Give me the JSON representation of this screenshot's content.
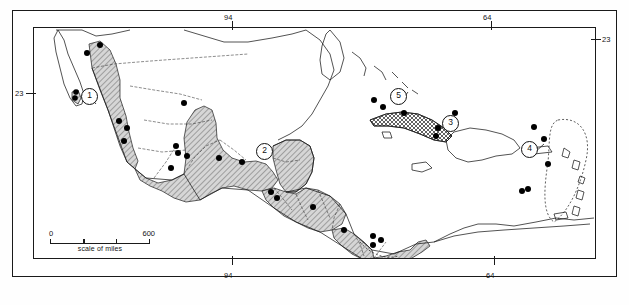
{
  "figure": {
    "kind": "distribution-map",
    "region": "Mexico, Central America and the Caribbean",
    "partial_caption": ""
  },
  "graticule": {
    "labels": [
      {
        "name": "top-longitude-94",
        "text": "94",
        "x": 228,
        "y": 13,
        "tick": "down"
      },
      {
        "name": "top-longitude-64",
        "text": "64",
        "x": 487,
        "y": 13,
        "tick": "down"
      },
      {
        "name": "left-latitude-23",
        "text": "23",
        "x": 16,
        "y": 92,
        "tick": "right"
      },
      {
        "name": "right-latitude-23",
        "text": "23",
        "x": 601,
        "y": 38,
        "tick": "left"
      },
      {
        "name": "bottom-longitude-94",
        "text": "94",
        "x": 228,
        "y": 272,
        "tick": "up"
      },
      {
        "name": "bottom-longitude-64",
        "text": "64",
        "x": 490,
        "y": 272,
        "tick": "up"
      }
    ]
  },
  "scale_bar": {
    "min_label": "0",
    "max_label": "600",
    "caption": "scale of miles"
  },
  "regions": [
    {
      "number": "1",
      "name": "region-marker-1",
      "label": "1",
      "area": "northwestern Mexico / Sinaloa-Sonora",
      "x": 88,
      "y": 95
    },
    {
      "number": "2",
      "name": "region-marker-2",
      "label": "2",
      "area": "Yucatan Peninsula / southern Mexico",
      "x": 263,
      "y": 150
    },
    {
      "number": "3",
      "name": "region-marker-3",
      "label": "3",
      "area": "Hispaniola",
      "x": 449,
      "y": 122
    },
    {
      "number": "4",
      "name": "region-marker-4",
      "label": "4",
      "area": "Lesser Antilles",
      "x": 528,
      "y": 148
    },
    {
      "number": "5",
      "name": "region-marker-5",
      "label": "5",
      "area": "Cuba",
      "x": 397,
      "y": 95
    }
  ],
  "legend_colors": {
    "shaded_range": "#b9b9b9",
    "coastline": "#1a1a1a",
    "border": "#2a2a2a",
    "locality_dot": "#000000",
    "frame": "#1a1a1a",
    "background": "#ffffff"
  },
  "locality_dots": [
    {
      "x": 99,
      "y": 44
    },
    {
      "x": 86,
      "y": 52
    },
    {
      "x": 75,
      "y": 91
    },
    {
      "x": 74,
      "y": 97
    },
    {
      "x": 118,
      "y": 120
    },
    {
      "x": 126,
      "y": 127
    },
    {
      "x": 123,
      "y": 140
    },
    {
      "x": 183,
      "y": 102
    },
    {
      "x": 175,
      "y": 145
    },
    {
      "x": 177,
      "y": 152
    },
    {
      "x": 170,
      "y": 167
    },
    {
      "x": 186,
      "y": 155
    },
    {
      "x": 218,
      "y": 157
    },
    {
      "x": 241,
      "y": 161
    },
    {
      "x": 270,
      "y": 191
    },
    {
      "x": 276,
      "y": 197
    },
    {
      "x": 312,
      "y": 206
    },
    {
      "x": 343,
      "y": 229
    },
    {
      "x": 380,
      "y": 239
    },
    {
      "x": 372,
      "y": 244
    },
    {
      "x": 372,
      "y": 235
    },
    {
      "x": 373,
      "y": 99
    },
    {
      "x": 382,
      "y": 106
    },
    {
      "x": 403,
      "y": 112
    },
    {
      "x": 454,
      "y": 112
    },
    {
      "x": 437,
      "y": 127
    },
    {
      "x": 435,
      "y": 135
    },
    {
      "x": 533,
      "y": 126
    },
    {
      "x": 543,
      "y": 138
    },
    {
      "x": 547,
      "y": 163
    },
    {
      "x": 521,
      "y": 190
    },
    {
      "x": 527,
      "y": 188
    }
  ]
}
